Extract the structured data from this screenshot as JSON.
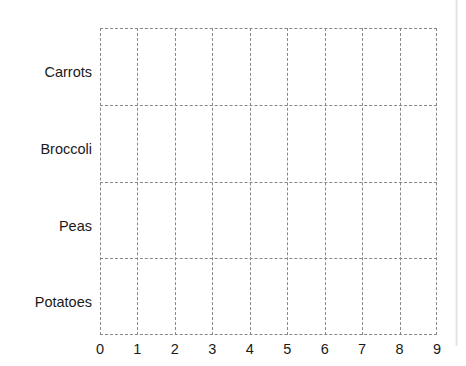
{
  "chart_data": {
    "type": "bar",
    "orientation": "horizontal",
    "title": "",
    "subtitle": "",
    "xlabel": "",
    "ylabel": "",
    "categories": [
      "Potatoes",
      "Peas",
      "Broccoli",
      "Carrots"
    ],
    "values": [
      0,
      0,
      0,
      0
    ],
    "series": [
      {
        "name": "",
        "values": [
          0,
          0,
          0,
          0
        ]
      }
    ],
    "xlim": [
      0,
      9
    ],
    "ylim": [
      0,
      4
    ],
    "x_ticks": [
      0,
      1,
      2,
      3,
      4,
      5,
      6,
      7,
      8,
      9
    ],
    "x_tick_labels": [
      "0",
      "1",
      "2",
      "3",
      "4",
      "5",
      "6",
      "7",
      "8",
      "9"
    ],
    "y_tick_labels": [
      "Carrots",
      "Broccoli",
      "Peas",
      "Potatoes"
    ],
    "grid": true,
    "grid_style": "dashed",
    "grid_color": "#888888",
    "legend": false,
    "legend_position": "none",
    "annotations": [],
    "background_color": "#ffffff",
    "bar_color": "#4c72b0",
    "text_color": "#1a1a1a",
    "note": "All four category bars have zero length; the plot shows only the dashed grid."
  },
  "axes": {
    "y_labels": [
      {
        "label": "Carrots"
      },
      {
        "label": "Broccoli"
      },
      {
        "label": "Peas"
      },
      {
        "label": "Potatoes"
      }
    ],
    "x_labels": [
      {
        "label": "0"
      },
      {
        "label": "1"
      },
      {
        "label": "2"
      },
      {
        "label": "3"
      },
      {
        "label": "4"
      },
      {
        "label": "5"
      },
      {
        "label": "6"
      },
      {
        "label": "7"
      },
      {
        "label": "8"
      },
      {
        "label": "9"
      }
    ]
  }
}
